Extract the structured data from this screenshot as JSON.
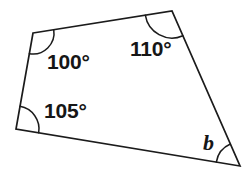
{
  "figure": {
    "name": "quadrilateral-angle-diagram",
    "shape": "quadrilateral",
    "background_color": "#ffffff",
    "stroke_color": "#1b1b1b",
    "text_color": "#161616",
    "vertices": {
      "top_left": {
        "x": 33,
        "y": 33
      },
      "top_right": {
        "x": 172,
        "y": 11
      },
      "bottom_right": {
        "x": 240,
        "y": 166
      },
      "bottom_left": {
        "x": 16,
        "y": 129
      }
    },
    "edges": [
      {
        "from": "top_left",
        "to": "top_right"
      },
      {
        "from": "top_right",
        "to": "bottom_right"
      },
      {
        "from": "bottom_right",
        "to": "bottom_left"
      },
      {
        "from": "bottom_left",
        "to": "top_left"
      }
    ]
  },
  "angles": [
    {
      "id": "angle-top-left",
      "label": "100°",
      "value": 100,
      "unit": "degrees",
      "vertex": "top_left",
      "arc_radius": 21
    },
    {
      "id": "angle-top-right",
      "label": "110°",
      "value": 110,
      "unit": "degrees",
      "vertex": "top_right",
      "arc_radius": 27
    },
    {
      "id": "angle-bottom-left",
      "label": "105°",
      "value": 105,
      "unit": "degrees",
      "vertex": "bottom_left",
      "arc_radius": 23
    },
    {
      "id": "angle-bottom-right",
      "label": "b",
      "value": null,
      "unit": "degrees",
      "vertex": "bottom_right",
      "arc_radius": 24,
      "is_unknown": true
    }
  ],
  "chart_data": {
    "type": "diagram",
    "title": "",
    "shape": "quadrilateral",
    "categories": [
      "100°",
      "110°",
      "105°",
      "b"
    ],
    "values": [
      100,
      110,
      105,
      null
    ],
    "labels": [
      "100°",
      "110°",
      "105°",
      "b"
    ],
    "annotations": [
      "100°",
      "110°",
      "105°",
      "b"
    ]
  }
}
